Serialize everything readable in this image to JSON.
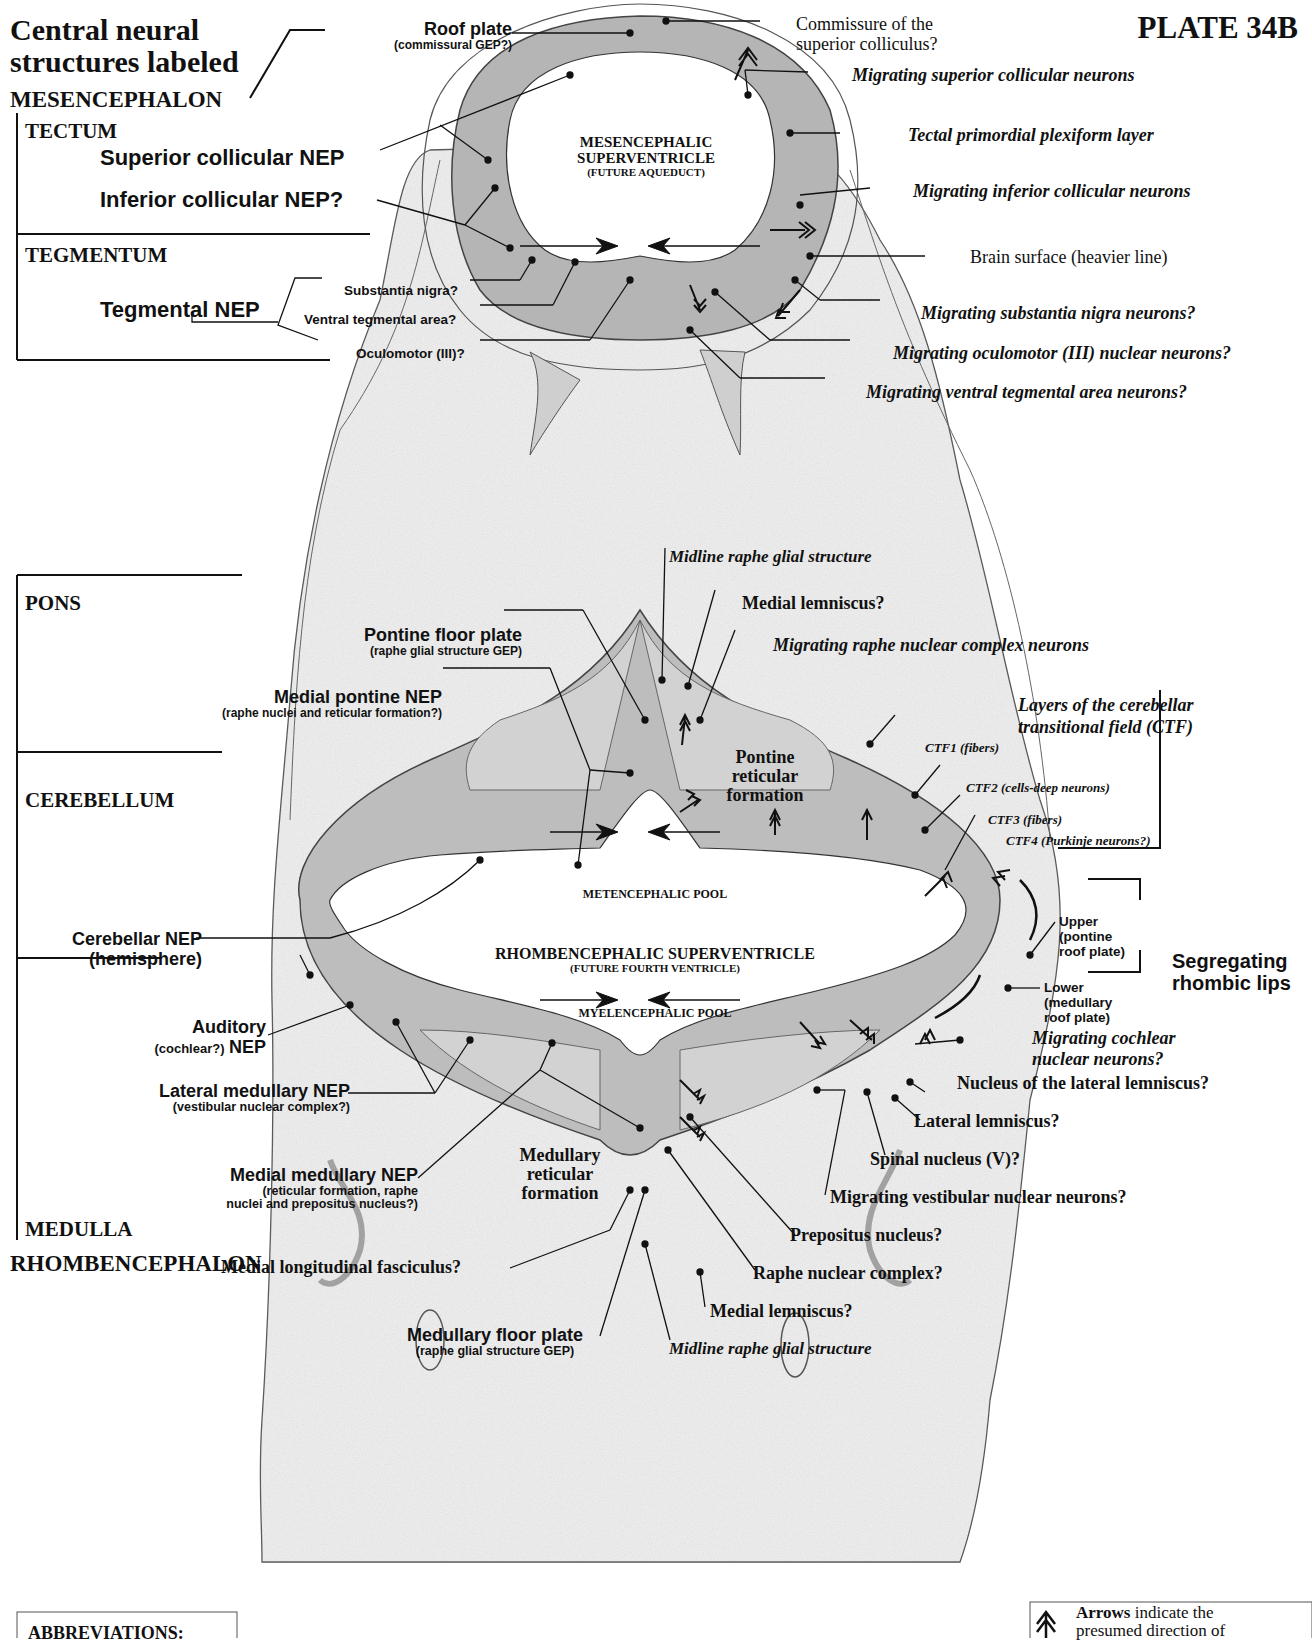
{
  "header": {
    "title_line1": "Central neural",
    "title_line2": "structures labeled",
    "plate": "PLATE 34B"
  },
  "divisions": {
    "mesencephalon": "MESENCEPHALON",
    "tectum": "TECTUM",
    "tegmentum": "TEGMENTUM",
    "pons": "PONS",
    "cerebellum": "CEREBELLUM",
    "medulla": "MEDULLA",
    "rhombencephalon": "RHOMBENCEPHALON"
  },
  "mesencephalon_labels": {
    "roof_plate": "Roof plate",
    "roof_plate_sub": "(commissural GEP?)",
    "superior_collicular_nep": "Superior collicular NEP",
    "inferior_collicular_nep": "Inferior collicular NEP?",
    "tegmental_nep": "Tegmental NEP",
    "substantia_nigra": "Substantia nigra?",
    "ventral_tegmental_area": "Ventral tegmental area?",
    "oculomotor": "Oculomotor (III)?",
    "commissure_line1": "Commissure of the",
    "commissure_line2": "superior colliculus?",
    "migrating_superior_collicular": "Migrating superior collicular neurons",
    "tectal_plexiform": "Tectal primordial plexiform layer",
    "migrating_inferior_collicular": "Migrating inferior collicular neurons",
    "brain_surface": "Brain surface (heavier line)",
    "migrating_substantia_nigra": "Migrating substantia nigra neurons?",
    "migrating_oculomotor": "Migrating oculomotor (III) nuclear neurons?",
    "migrating_vta": "Migrating ventral tegmental area neurons?",
    "ventricle_line1": "MESENCEPHALIC",
    "ventricle_line2": "SUPERVENTRICLE",
    "ventricle_sub": "(FUTURE AQUEDUCT)"
  },
  "pons_labels": {
    "midline_raphe_glial": "Midline raphe glial structure",
    "medial_lemniscus": "Medial lemniscus?",
    "migrating_raphe": "Migrating raphe nuclear complex neurons",
    "pontine_floor_plate": "Pontine floor plate",
    "pontine_floor_plate_sub": "(raphe glial structure GEP)",
    "medial_pontine_nep": "Medial pontine NEP",
    "medial_pontine_nep_sub": "(raphe nuclei and reticular formation?)",
    "pontine_reticular_l1": "Pontine",
    "pontine_reticular_l2": "reticular",
    "pontine_reticular_l3": "formation"
  },
  "cerebellum_labels": {
    "ctf_title_l1": "Layers of the cerebellar",
    "ctf_title_l2": "transitional field (CTF)",
    "ctf1": "CTF1 (fibers)",
    "ctf2": "CTF2 (cells-deep neurons)",
    "ctf3": "CTF3 (fibers)",
    "ctf4": "CTF4 (Purkinje neurons?)",
    "cerebellar_nep": "Cerebellar NEP",
    "cerebellar_nep_sub": "(hemisphere)",
    "metencephalic_pool": "METENCEPHALIC POOL",
    "ventricle_main": "RHOMBENCEPHALIC SUPERVENTRICLE",
    "ventricle_sub": "(FUTURE FOURTH VENTRICLE)",
    "myelencephalic_pool": "MYELENCEPHALIC POOL",
    "upper_l1": "Upper",
    "upper_l2": "(pontine",
    "upper_l3": "roof plate)",
    "lower_l1": "Lower",
    "lower_l2": "(medullary",
    "lower_l3": "roof plate)",
    "segregating_l1": "Segregating",
    "segregating_l2": "rhombic lips"
  },
  "medulla_labels": {
    "auditory_l1": "Auditory",
    "auditory_sub": "(cochlear?)",
    "auditory_nep": "NEP",
    "lateral_medullary_nep": "Lateral medullary NEP",
    "lateral_medullary_nep_sub": "(vestibular nuclear complex?)",
    "medial_medullary_nep": "Medial medullary NEP",
    "medial_medullary_nep_sub1": "(reticular formation, raphe",
    "medial_medullary_nep_sub2": "nuclei and prepositus nucleus?)",
    "medullary_reticular_l1": "Medullary",
    "medullary_reticular_l2": "reticular",
    "medullary_reticular_l3": "formation",
    "mlf": "Medial longitudinal fasciculus?",
    "medullary_floor_plate": "Medullary floor plate",
    "medullary_floor_plate_sub": "(raphe glial structure GEP)",
    "migrating_cochlear_l1": "Migrating cochlear",
    "migrating_cochlear_l2": "nuclear neurons?",
    "nucleus_lateral_lemniscus": "Nucleus of the lateral lemniscus?",
    "lateral_lemniscus": "Lateral lemniscus?",
    "spinal_nucleus": "Spinal nucleus (V)?",
    "migrating_vestibular": "Migrating vestibular nuclear neurons?",
    "prepositus": "Prepositus nucleus?",
    "raphe_nuclear_complex": "Raphe nuclear complex?",
    "medial_lemniscus": "Medial lemniscus?",
    "midline_raphe_glial": "Midline raphe glial structure"
  },
  "footer": {
    "abbreviations_title": "ABBREVIATIONS:",
    "arrows_bold": "Arrows",
    "arrows_text": " indicate the",
    "arrows_line2": "presumed direction of",
    "arrow_icon": "double-chevron-up-icon"
  },
  "colors": {
    "ink": "#111111",
    "tissue_light": "#e4e4e4",
    "tissue_mid": "#b9b9b9",
    "tissue_dark": "#8a8a8a",
    "background": "#ffffff"
  }
}
